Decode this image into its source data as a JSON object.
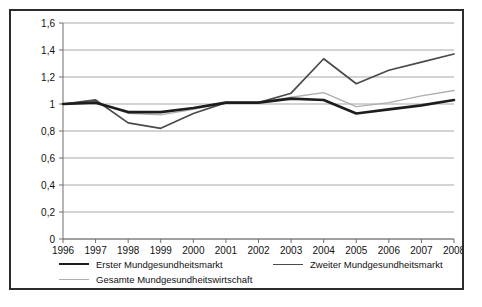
{
  "chart_data": {
    "type": "line",
    "title": "",
    "subtitle": "",
    "xlabel": "",
    "ylabel": "",
    "categories": [
      "1996",
      "1997",
      "1998",
      "1999",
      "2000",
      "2001",
      "2002",
      "2003",
      "2004",
      "2005",
      "2006",
      "2007",
      "2008"
    ],
    "x": [
      1996,
      1997,
      1998,
      1999,
      2000,
      2001,
      2002,
      2003,
      2004,
      2005,
      2006,
      2007,
      2008
    ],
    "ylim": [
      0,
      1.6
    ],
    "xlim": [
      1996,
      2008
    ],
    "yticks": [
      0,
      0.2,
      0.4,
      0.6,
      0.8,
      1.0,
      1.2,
      1.4,
      1.6
    ],
    "ytick_labels": [
      "0",
      "0,2",
      "0,4",
      "0,6",
      "0,8",
      "1",
      "1,2",
      "1,4",
      "1,6"
    ],
    "grid": true,
    "grid_axis": "y",
    "legend_position": "bottom",
    "series": [
      {
        "name": "Erster Mundgesundheitsmarkt",
        "color": "#1d1d1d",
        "width": 2.6,
        "values": [
          1.0,
          1.01,
          0.94,
          0.94,
          0.97,
          1.01,
          1.01,
          1.04,
          1.03,
          0.93,
          0.96,
          0.99,
          1.03
        ]
      },
      {
        "name": "Zweiter Mundgesundheitsmarkt",
        "color": "#4a4a4a",
        "width": 1.7,
        "values": [
          1.0,
          1.03,
          0.86,
          0.82,
          0.93,
          1.01,
          1.01,
          1.08,
          1.335,
          1.15,
          1.25,
          1.31,
          1.37
        ]
      },
      {
        "name": "Gesamte Mundgesundheitswirtschaft",
        "color": "#aeaeae",
        "width": 1.3,
        "values": [
          1.0,
          1.02,
          0.93,
          0.92,
          0.96,
          1.01,
          1.01,
          1.05,
          1.085,
          0.98,
          1.01,
          1.06,
          1.1
        ]
      }
    ]
  },
  "legend": {
    "erster": "Erster Mundgesundheitsmarkt",
    "zweiter": "Zweiter Mundgesundheitsmarkt",
    "gesamte": "Gesamte Mundgesundheitswirtschaft"
  },
  "colors": {
    "border": "#2c2c2c",
    "grid": "#9d9d9d",
    "axis": "#6e6e6e",
    "text": "#111111",
    "background": "#ffffff"
  }
}
